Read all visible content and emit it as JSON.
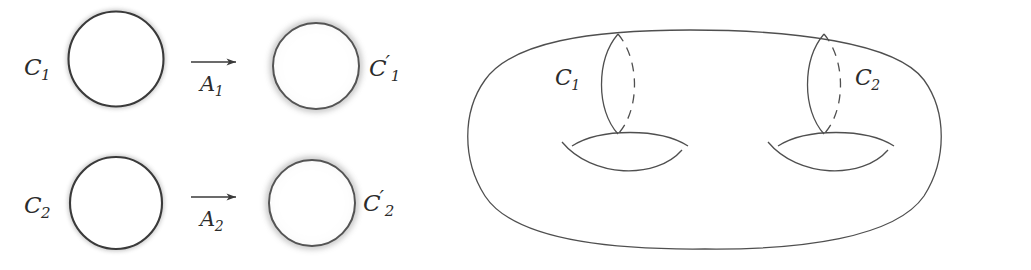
{
  "figure": {
    "width": 1031,
    "height": 270,
    "background": "#ffffff",
    "stroke_color": "#3a3a3a",
    "soft_stroke_color": "#555555"
  },
  "left_panel": {
    "name": "circles-and-arrows-panel",
    "rows": [
      {
        "source_label": {
          "base": "C",
          "sub": "1",
          "prime": ""
        },
        "arrow_label": {
          "base": "A",
          "sub": "1",
          "prime": ""
        },
        "target_label": {
          "base": "C",
          "sub": "1",
          "prime": "′"
        }
      },
      {
        "source_label": {
          "base": "C",
          "sub": "2",
          "prime": ""
        },
        "arrow_label": {
          "base": "A",
          "sub": "2",
          "prime": ""
        },
        "target_label": {
          "base": "C",
          "sub": "2",
          "prime": "′"
        }
      }
    ]
  },
  "right_panel": {
    "name": "genus-two-surface-panel",
    "curve_labels": [
      {
        "base": "C",
        "sub": "1",
        "prime": ""
      },
      {
        "base": "C",
        "sub": "2",
        "prime": ""
      }
    ]
  }
}
